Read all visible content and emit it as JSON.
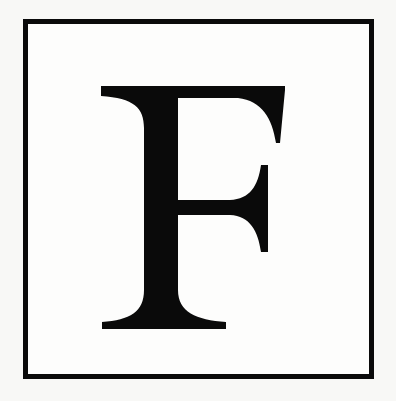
{
  "document": {
    "type": "decorative-initial",
    "drop_cap": {
      "letter": "F",
      "style": "serif capital in bordered box"
    },
    "colors": {
      "ink": "#0a0a0a",
      "paper": "#f8f8f6"
    }
  }
}
